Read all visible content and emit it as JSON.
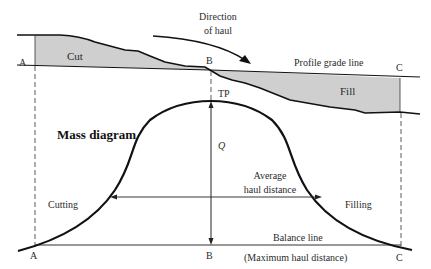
{
  "diagram": {
    "title": "Mass diagram",
    "colors": {
      "line": "#111111",
      "fill_area": "#cfcfcf",
      "dashed": "#333333",
      "text": "#2a2a2a"
    },
    "profile": {
      "points": {
        "A": "A",
        "B": "B",
        "C": "C"
      },
      "cut_label": "Cut",
      "fill_label": "Fill",
      "grade_line_label": "Profile grade line",
      "direction_label_line1": "Direction",
      "direction_label_line2": "of haul"
    },
    "mass_curve": {
      "points": {
        "A": "A",
        "B": "B",
        "C": "C"
      },
      "turning_point_label": "TP",
      "ordinate_label": "Q",
      "cutting_label": "Cutting",
      "filling_label": "Filling",
      "average_haul_line1": "Average",
      "average_haul_line2": "haul distance",
      "balance_line_label": "Balance line",
      "max_haul_label": "(Maximum haul distance)"
    }
  }
}
